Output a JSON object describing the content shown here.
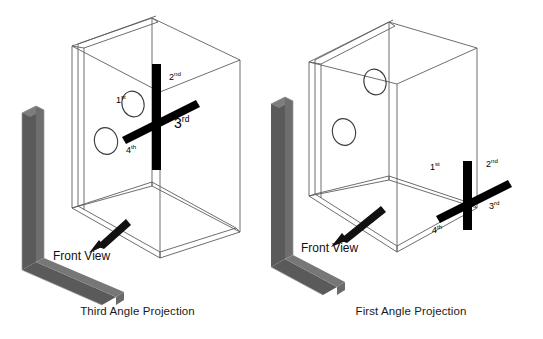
{
  "figure": {
    "background_color": "#ffffff",
    "line_color": "#555555",
    "bar_color": "#000000",
    "plane_color": "#5a5a5a",
    "plane_edge_color": "#8d8d8d",
    "text_color": "#1a1a1a"
  },
  "panels": [
    {
      "id": "third-angle",
      "caption": "Third Angle Projection",
      "front_view_label": "Front View",
      "quadrants": [
        {
          "key": "first",
          "number": "1",
          "suffix": "st"
        },
        {
          "key": "second",
          "number": "2",
          "suffix": "nd"
        },
        {
          "key": "third",
          "number": "3",
          "suffix": "rd"
        },
        {
          "key": "fourth",
          "number": "4",
          "suffix": "th"
        }
      ]
    },
    {
      "id": "first-angle",
      "caption": "First Angle Projection",
      "front_view_label": "Front View",
      "quadrants": [
        {
          "key": "first",
          "number": "1",
          "suffix": "st"
        },
        {
          "key": "second",
          "number": "2",
          "suffix": "nd"
        },
        {
          "key": "third",
          "number": "3",
          "suffix": "rd"
        },
        {
          "key": "fourth",
          "number": "4",
          "suffix": "th"
        }
      ]
    }
  ]
}
